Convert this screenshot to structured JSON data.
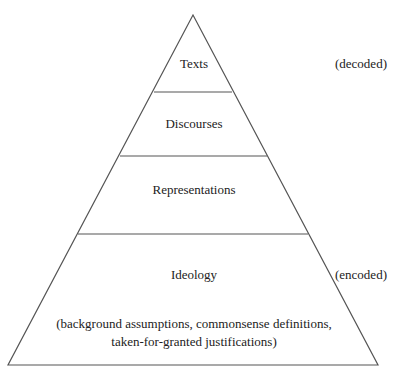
{
  "diagram": {
    "type": "pyramid",
    "levels": [
      {
        "label": "Texts"
      },
      {
        "label": "Discourses"
      },
      {
        "label": "Representations"
      },
      {
        "label": "Ideology",
        "sublabel_line1": "(background assumptions, commonsense definitions,",
        "sublabel_line2": "taken-for-granted justifications)"
      }
    ],
    "side_labels": {
      "top": "(decoded)",
      "bottom": "(encoded)"
    },
    "colors": {
      "line": "#555555",
      "text": "#222222",
      "background": "#ffffff"
    }
  }
}
